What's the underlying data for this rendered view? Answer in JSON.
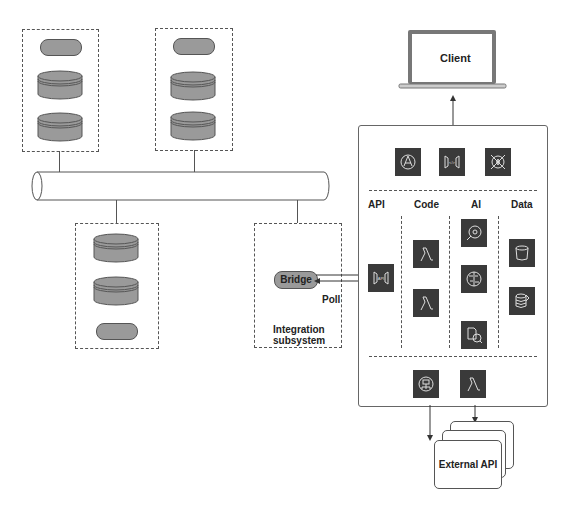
{
  "client": {
    "label": "Client"
  },
  "bridge": {
    "label": "Bridge",
    "poll_label": "Poll"
  },
  "integration": {
    "line1": "Integration",
    "line2": "subsystem"
  },
  "panel": {
    "top_icons": [
      "globe-network-icon",
      "api-gateway-icon",
      "shield-fire-icon"
    ],
    "columns": [
      {
        "label": "API",
        "icons": [
          "api-gateway-icon"
        ]
      },
      {
        "label": "Code",
        "icons": [
          "lambda-icon",
          "lambda-icon"
        ]
      },
      {
        "label": "AI",
        "icons": [
          "search-analytics-icon",
          "brain-icon",
          "document-analysis-icon"
        ]
      },
      {
        "label": "Data",
        "icons": [
          "bucket-icon",
          "database-icon"
        ]
      }
    ],
    "bottom_icons": [
      "notification-icon",
      "lambda-icon"
    ]
  },
  "external": {
    "label": "External API"
  },
  "colors": {
    "icon_bg": "#3a3a3a",
    "db_fill": "#9a9a9a",
    "line": "#555555"
  }
}
